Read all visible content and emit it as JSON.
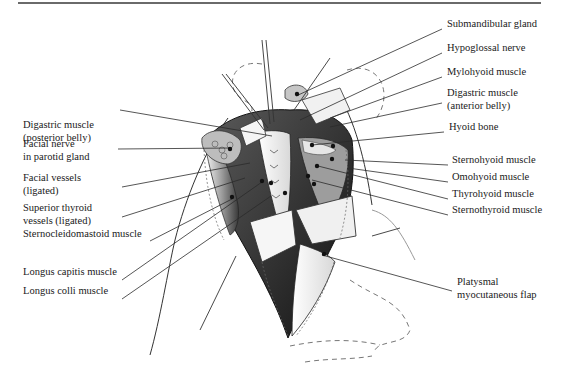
{
  "figure": {
    "type": "anatomical-illustration"
  },
  "labels_left": [
    {
      "id": "digastric-posterior",
      "lines": [
        "Digastric muscle",
        "(posterior belly)"
      ],
      "x": 23,
      "y": 124
    },
    {
      "id": "facial-nerve",
      "lines": [
        "Facial nerve",
        "in parotid gland"
      ],
      "x": 23,
      "y": 143
    },
    {
      "id": "facial-vessels",
      "lines": [
        "Facial vessels",
        "(ligated)"
      ],
      "x": 23,
      "y": 177
    },
    {
      "id": "superior-thyroid",
      "lines": [
        "Superior thyroid",
        "vessels (ligated)"
      ],
      "x": 23,
      "y": 207
    },
    {
      "id": "sternocleidomastoid",
      "lines": [
        "Sternocleidomastoid muscle"
      ],
      "x": 23,
      "y": 233
    },
    {
      "id": "longus-capitis",
      "lines": [
        "Longus capitis muscle"
      ],
      "x": 23,
      "y": 271
    },
    {
      "id": "longus-colli",
      "lines": [
        "Longus colli  muscle"
      ],
      "x": 23,
      "y": 290
    }
  ],
  "labels_right": [
    {
      "id": "submandibular-gland",
      "lines": [
        "Submandibular gland"
      ],
      "x": 447,
      "y": 23
    },
    {
      "id": "hypoglossal-nerve",
      "lines": [
        "Hypoglossal nerve"
      ],
      "x": 447,
      "y": 47
    },
    {
      "id": "mylohyoid",
      "lines": [
        "Mylohyoid muscle"
      ],
      "x": 447,
      "y": 71
    },
    {
      "id": "digastric-anterior",
      "lines": [
        "Digastric muscle",
        "(anterior belly)"
      ],
      "x": 447,
      "y": 92
    },
    {
      "id": "hyoid-bone",
      "lines": [
        "Hyoid bone"
      ],
      "x": 449,
      "y": 126
    },
    {
      "id": "sternohyoid",
      "lines": [
        "Sternohyoid muscle"
      ],
      "x": 452,
      "y": 159
    },
    {
      "id": "omohyoid",
      "lines": [
        "Omohyoid muscle"
      ],
      "x": 452,
      "y": 176
    },
    {
      "id": "thyrohyoid",
      "lines": [
        "Thyrohyoid muscle"
      ],
      "x": 452,
      "y": 193
    },
    {
      "id": "sternothyroid",
      "lines": [
        "Sternothyroid muscle"
      ],
      "x": 452,
      "y": 209
    },
    {
      "id": "platysmal-flap",
      "lines": [
        "Platysmal",
        "myocutaneous flap"
      ],
      "x": 457,
      "y": 281
    }
  ],
  "leader_lines": [
    {
      "for": "submandibular-gland",
      "x1": 442,
      "y1": 29,
      "x2": 296,
      "y2": 96
    },
    {
      "for": "hypoglossal-nerve",
      "x1": 442,
      "y1": 53,
      "x2": 300,
      "y2": 120
    },
    {
      "for": "mylohyoid",
      "x1": 442,
      "y1": 77,
      "x2": 330,
      "y2": 118
    },
    {
      "for": "digastric-anterior",
      "x1": 442,
      "y1": 103,
      "x2": 330,
      "y2": 127
    },
    {
      "for": "hyoid-bone",
      "x1": 444,
      "y1": 132,
      "x2": 312,
      "y2": 145
    },
    {
      "for": "sternohyoid",
      "x1": 448,
      "y1": 165,
      "x2": 345,
      "y2": 160
    },
    {
      "for": "omohyoid",
      "x1": 448,
      "y1": 182,
      "x2": 348,
      "y2": 168
    },
    {
      "for": "thyrohyoid",
      "x1": 448,
      "y1": 199,
      "x2": 318,
      "y2": 166
    },
    {
      "for": "sternothyroid",
      "x1": 448,
      "y1": 215,
      "x2": 312,
      "y2": 180
    },
    {
      "for": "platysmal-flap",
      "x1": 452,
      "y1": 291,
      "x2": 322,
      "y2": 255
    },
    {
      "for": "digastric-posterior",
      "x1": 120,
      "y1": 110,
      "x2": 272,
      "y2": 136
    },
    {
      "for": "facial-nerve",
      "x1": 118,
      "y1": 149,
      "x2": 232,
      "y2": 148
    },
    {
      "for": "facial-vessels",
      "x1": 122,
      "y1": 187,
      "x2": 250,
      "y2": 163
    },
    {
      "for": "superior-thyroid",
      "x1": 122,
      "y1": 217,
      "x2": 245,
      "y2": 178
    },
    {
      "for": "sternocleidomastoid",
      "x1": 150,
      "y1": 241,
      "x2": 232,
      "y2": 199
    },
    {
      "for": "longus-capitis",
      "x1": 122,
      "y1": 280,
      "x2": 262,
      "y2": 182
    },
    {
      "for": "longus-colli",
      "x1": 122,
      "y1": 299,
      "x2": 271,
      "y2": 196
    }
  ],
  "dots": [
    [
      297,
      94
    ],
    [
      230,
      149
    ],
    [
      232,
      197
    ],
    [
      312,
      145
    ],
    [
      333,
      146
    ],
    [
      332,
      159
    ],
    [
      317,
      166
    ],
    [
      308,
      176
    ],
    [
      314,
      184
    ],
    [
      271,
      183
    ],
    [
      285,
      193
    ],
    [
      262,
      181
    ],
    [
      324,
      254
    ]
  ],
  "colors": {
    "ink": "#1a1a1a",
    "leader": "#2b2b2b",
    "rule": "#6a6a6a",
    "shade_dark": "#2a2a2a",
    "shade_mid": "#7a7a7a",
    "shade_light": "#c8c8c8"
  }
}
